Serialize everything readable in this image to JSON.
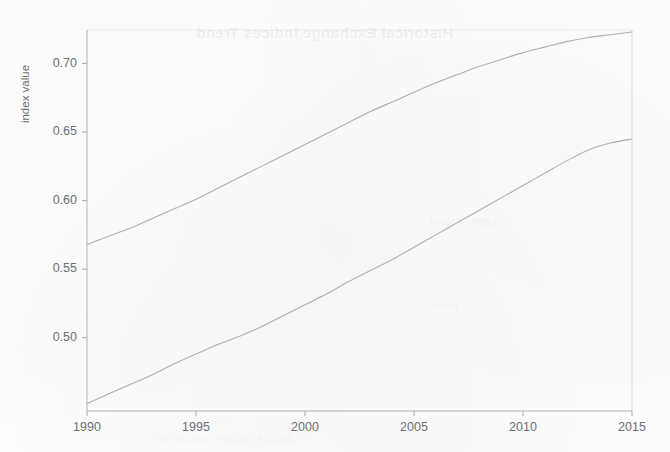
{
  "figure": {
    "background_color": "#fefefe",
    "line_color": "#a9a9ae",
    "axis_color": "#9a9a9f",
    "text_color": "#6e6e72"
  },
  "ghost_text": {
    "title": "Historical Exchange Indices Trend",
    "mid": "upper bound",
    "lower": "index",
    "footer": "Source: author calculations"
  },
  "chart_data": {
    "type": "line",
    "title": "",
    "xlabel": "",
    "ylabel": "index value",
    "xlim": [
      1990,
      2015
    ],
    "ylim": [
      0.4465,
      0.7245
    ],
    "grid": false,
    "legend": null,
    "xticks": [
      1990,
      1995,
      2000,
      2005,
      2010,
      2015
    ],
    "xtick_labels": [
      "1990",
      "1995",
      "2000",
      "2005",
      "2010",
      "2015"
    ],
    "yticks": [
      0.5,
      0.55,
      0.6,
      0.65,
      0.7
    ],
    "ytick_labels": [
      "0.50",
      "0.55",
      "0.60",
      "0.65",
      "0.70"
    ],
    "x": [
      1990,
      1991,
      1992,
      1993,
      1994,
      1995,
      1996,
      1997,
      1998,
      1999,
      2000,
      2001,
      2002,
      2003,
      2004,
      2005,
      2006,
      2007,
      2008,
      2009,
      2010,
      2011,
      2012,
      2013,
      2014,
      2015
    ],
    "series": [
      {
        "name": "upper curve",
        "color": "#a9a9ae",
        "values": [
          0.568,
          0.574,
          0.58,
          0.587,
          0.594,
          0.601,
          0.609,
          0.617,
          0.625,
          0.633,
          0.641,
          0.649,
          0.657,
          0.665,
          0.672,
          0.679,
          0.686,
          0.692,
          0.698,
          0.703,
          0.708,
          0.712,
          0.716,
          0.719,
          0.721,
          0.723
        ]
      },
      {
        "name": "lower curve",
        "color": "#a9a9ae",
        "values": [
          0.452,
          0.459,
          0.466,
          0.473,
          0.481,
          0.488,
          0.495,
          0.501,
          0.508,
          0.516,
          0.524,
          0.532,
          0.541,
          0.549,
          0.557,
          0.566,
          0.575,
          0.584,
          0.593,
          0.602,
          0.611,
          0.62,
          0.629,
          0.637,
          0.642,
          0.645
        ]
      }
    ]
  },
  "plot_geometry": {
    "left": 87,
    "right": 632,
    "top": 30,
    "bottom": 411
  }
}
